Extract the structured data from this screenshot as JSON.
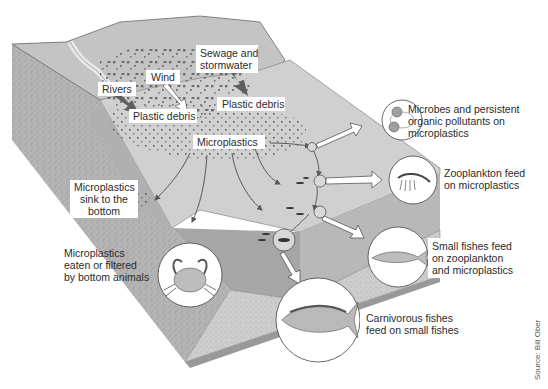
{
  "diagram": {
    "labels": {
      "sewage": [
        "Sewage and",
        "stormwater"
      ],
      "wind": "Wind",
      "rivers": "Rivers",
      "plastic_debris_left": "Plastic debris",
      "plastic_debris_right": "Plastic debris",
      "microplastics": "Microplastics",
      "sink": [
        "Microplastics",
        "sink to the",
        "bottom"
      ],
      "bottom_animals": [
        "Microplastics",
        "eaten or filtered",
        "by bottom animals"
      ],
      "microbes": [
        "Microbes and persistent",
        "organic pollutants on",
        "microplastics"
      ],
      "zooplankton": [
        "Zooplankton feed",
        "on microplastics"
      ],
      "small_fishes": [
        "Small fishes feed",
        "on zooplankton",
        "and microplastics"
      ],
      "carnivorous": [
        "Carnivorous fishes",
        "feed on small fishes"
      ]
    },
    "source": "Source: Bill Ober",
    "colors": {
      "land": "#c9c9c9",
      "land_dark": "#a8a8a8",
      "sea_surface": "#d6d6d6",
      "water_side": "#9d9d9d",
      "seabed": "#8c8c8c",
      "sediment": "#cfcfcf",
      "debris": "#555555",
      "arrow": "#5a5a5a"
    }
  }
}
